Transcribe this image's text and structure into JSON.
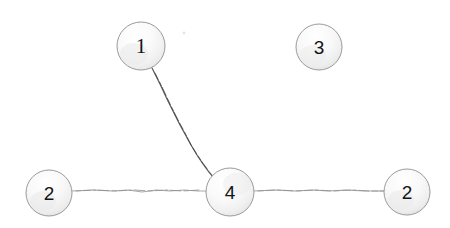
{
  "diagram": {
    "background_color": "#ffffff",
    "node_fill_light": "#fefefe",
    "node_fill_mid": "#f2f2f2",
    "node_fill_shade": "#e2e2e2",
    "node_stroke_color": "#9a9a9a",
    "node_label_color": "#141414",
    "edge_color_dark": "#5a5a5a",
    "edge_color_light": "#a8a8a8",
    "nodes": [
      {
        "id": "n1",
        "label": "1",
        "cx": 141,
        "cy": 46,
        "r": 24
      },
      {
        "id": "n2",
        "label": "2",
        "cx": 49,
        "cy": 193,
        "r": 23
      },
      {
        "id": "n3",
        "label": "3",
        "cx": 319,
        "cy": 47,
        "r": 23
      },
      {
        "id": "n4",
        "label": "4",
        "cx": 230,
        "cy": 192,
        "r": 24
      },
      {
        "id": "n5",
        "label": "2",
        "cx": 407,
        "cy": 192,
        "r": 23
      }
    ],
    "edges": [
      {
        "id": "e1",
        "from": "n1",
        "to": "n4",
        "style": "dark-diagonal"
      },
      {
        "id": "e2",
        "from": "n2",
        "to": "n4",
        "style": "light-horizontal"
      },
      {
        "id": "e3",
        "from": "n4",
        "to": "n5",
        "style": "light-horizontal"
      }
    ],
    "artifact": {
      "cx": 184,
      "cy": 33,
      "r": 1.6
    }
  }
}
